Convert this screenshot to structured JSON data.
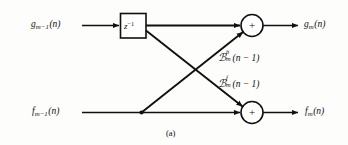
{
  "figure": {
    "caption": "(a)",
    "background": "#fdfdfc",
    "line_color": "#101010"
  },
  "inputs": {
    "top": {
      "base": "g",
      "sub": "m−1",
      "arg": "(n)",
      "full": "g_{m-1}(n)"
    },
    "bottom": {
      "base": "f",
      "sub": "m−1",
      "arg": "(n)",
      "full": "f_{m-1}(n)"
    }
  },
  "outputs": {
    "top": {
      "base": "g",
      "sub": "m",
      "arg": "(n)",
      "full": "g_m(n)"
    },
    "bottom": {
      "base": "f",
      "sub": "m",
      "arg": "(n)",
      "full": "f_m(n)"
    }
  },
  "delay_block": {
    "base": "z",
    "exponent": "−1",
    "full": "z^{-1}"
  },
  "coefficients": [
    {
      "symbol": "ℬ",
      "letter": "K",
      "superscript": "b",
      "subscript": "m",
      "arg": "(n − 1)",
      "full": "K_m^b(n-1)",
      "role": "backward-reflection-coefficient"
    },
    {
      "symbol": "ℬ",
      "letter": "K",
      "superscript": "f",
      "subscript": "m",
      "arg": "(n − 1)",
      "full": "K_m^f(n-1)",
      "role": "forward-reflection-coefficient"
    }
  ],
  "adders": [
    {
      "id": "top-adder",
      "operator": "+"
    },
    {
      "id": "bottom-adder",
      "operator": "+"
    }
  ]
}
